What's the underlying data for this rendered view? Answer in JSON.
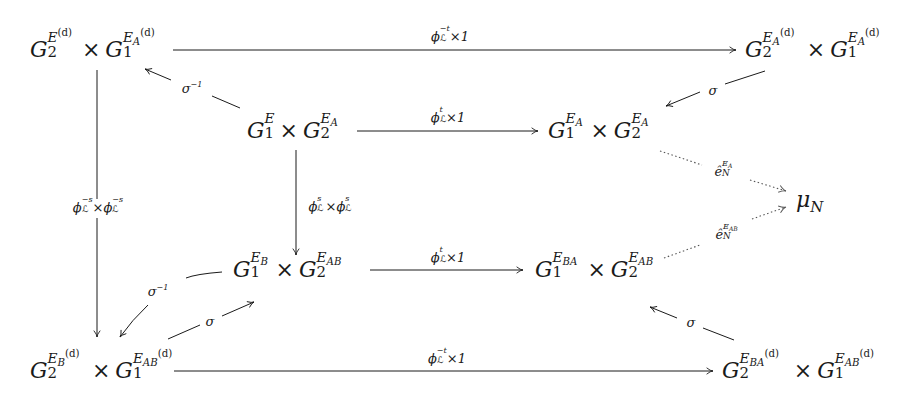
{
  "diagram": {
    "type": "commutative-diagram",
    "nodes": {
      "tl": {
        "base1": "G",
        "sub1": "2",
        "sup1": "E",
        "sup1_extra": "(d)",
        "sup1_sub": "",
        "times": "×",
        "base2": "G",
        "sub2": "1",
        "sup2": "E",
        "sup2_sub": "A",
        "sup2_extra": "(d)"
      },
      "tr": {
        "base1": "G",
        "sub1": "2",
        "sup1": "E",
        "sup1_sub": "A",
        "sup1_extra": "(d)",
        "times": "×",
        "base2": "G",
        "sub2": "1",
        "sup2": "E",
        "sup2_sub": "A",
        "sup2_extra": "(d)"
      },
      "ml": {
        "base1": "G",
        "sub1": "1",
        "sup1": "E",
        "sup1_sub": "",
        "times": "×",
        "base2": "G",
        "sub2": "2",
        "sup2": "E",
        "sup2_sub": "A"
      },
      "mr": {
        "base1": "G",
        "sub1": "1",
        "sup1": "E",
        "sup1_sub": "A",
        "times": "×",
        "base2": "G",
        "sub2": "2",
        "sup2": "E",
        "sup2_sub": "A"
      },
      "mu": {
        "base": "μ",
        "sub": "N"
      },
      "bl2": {
        "base1": "G",
        "sub1": "1",
        "sup1": "E",
        "sup1_sub": "B",
        "times": "×",
        "base2": "G",
        "sub2": "2",
        "sup2": "E",
        "sup2_sub": "AB"
      },
      "br2": {
        "base1": "G",
        "sub1": "1",
        "sup1": "E",
        "sup1_sub": "BA",
        "times": "×",
        "base2": "G",
        "sub2": "2",
        "sup2": "E",
        "sup2_sub": "AB"
      },
      "bl": {
        "base1": "G",
        "sub1": "2",
        "sup1": "E",
        "sup1_sub": "B",
        "sup1_extra": "(d)",
        "times": "×",
        "base2": "G",
        "sub2": "1",
        "sup2": "E",
        "sup2_sub": "AB",
        "sup2_extra": "(d)"
      },
      "br": {
        "base1": "G",
        "sub1": "2",
        "sup1": "E",
        "sup1_sub": "BA",
        "sup1_extra": "(d)",
        "times": "×",
        "base2": "G",
        "sub2": "1",
        "sup2": "E",
        "sup2_sub": "AB",
        "sup2_extra": "(d)"
      }
    },
    "arrows": {
      "top": {
        "phi": "ϕ",
        "sub": "ℒ",
        "sup": "−t",
        "rest": "×1"
      },
      "mid_top": {
        "phi": "ϕ",
        "sub": "ℒ",
        "sup": "t",
        "rest": "×1"
      },
      "mid_bot": {
        "phi": "ϕ",
        "sub": "ℒ",
        "sup": "t",
        "rest": "×1"
      },
      "bottom": {
        "phi": "ϕ",
        "sub": "ℒ",
        "sup": "−t",
        "rest": "×1"
      },
      "left_vert": {
        "phi1": "ϕ",
        "sub1": "ℒ",
        "sup1": "−s",
        "times": "×",
        "phi2": "ϕ",
        "sub2": "ℒ",
        "sup2": "−s"
      },
      "center_vert": {
        "phi1": "ϕ",
        "sub1": "ℒ",
        "sup1": "s",
        "times": "×",
        "phi2": "ϕ",
        "sub2": "ℒ",
        "sup2": "s"
      },
      "sigma_inv_top": {
        "base": "σ",
        "sup": "−1"
      },
      "sigma_top_right": {
        "base": "σ"
      },
      "sigma_inv_bot": {
        "base": "σ",
        "sup": "−1"
      },
      "sigma_bot_left": {
        "base": "σ"
      },
      "sigma_bot_right": {
        "base": "σ"
      },
      "e_top": {
        "base": "ê",
        "sub": "N",
        "sup": "E",
        "sup_sub": "A"
      },
      "e_bot": {
        "base": "ê",
        "sub": "N",
        "sup": "E",
        "sup_sub": "AB"
      }
    },
    "colors": {
      "ink": "#1a1a1a",
      "background": "#ffffff",
      "dotted": "#555555"
    }
  }
}
